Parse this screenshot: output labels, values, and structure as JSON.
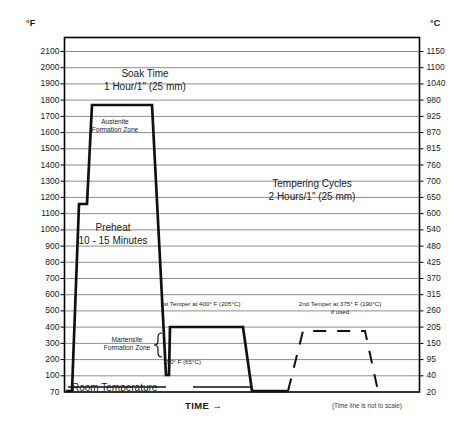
{
  "axes": {
    "fahrenheit_unit": "°F",
    "celsius_unit": "°C",
    "fahrenheit_ticks": [
      "2100",
      "2000",
      "1900",
      "1800",
      "1700",
      "1600",
      "1500",
      "1400",
      "1300",
      "1200",
      "1100",
      "1000",
      "900",
      "800",
      "700",
      "600",
      "500",
      "400",
      "300",
      "200",
      "100",
      "70"
    ],
    "celsius_ticks": [
      "1150",
      "1100",
      "1040",
      "980",
      "925",
      "870",
      "815",
      "760",
      "700",
      "650",
      "600",
      "540",
      "480",
      "425",
      "370",
      "315",
      "260",
      "205",
      "150",
      "95",
      "40",
      "20"
    ],
    "x_axis_label": "TIME  →",
    "scale_note": "(Time line is not to scale)"
  },
  "annotations": {
    "soak_line1": "Soak Time",
    "soak_line2": "1 Hour/1\" (25 mm)",
    "austenite_line1": "Austenite",
    "austenite_line2": "Formation Zone",
    "preheat_line1": "Preheat",
    "preheat_line2": "10 - 15 Minutes",
    "tempering_line1": "Tempering Cycles",
    "tempering_line2": "2 Hours/1\" (25 mm)",
    "temper1": "1st Temper at 400° F (205°C)",
    "temper2_line1": "2nd Temper at 375° F (190°C)",
    "temper2_line2": "if used",
    "martensite_line1": "Martensite",
    "martensite_line2": "Formation Zone",
    "quench_temp": "150° F (65°C)",
    "room_temperature": "Room Temperature"
  },
  "chart_data": {
    "type": "line",
    "xlabel": "TIME  →",
    "ylabel": "°F",
    "ylabel_secondary": "°C",
    "ylim": [
      70,
      2150
    ],
    "grid": true,
    "legend": "none",
    "yticks_f": [
      2100,
      2000,
      1900,
      1800,
      1700,
      1600,
      1500,
      1400,
      1300,
      1200,
      1100,
      1000,
      900,
      800,
      700,
      600,
      500,
      400,
      300,
      200,
      100,
      70
    ],
    "yticks_c": [
      1150,
      1100,
      1040,
      980,
      925,
      870,
      815,
      760,
      700,
      650,
      600,
      540,
      480,
      425,
      370,
      315,
      260,
      205,
      150,
      95,
      40,
      20
    ],
    "series": [
      {
        "name": "Primary heat treat cycle",
        "style": "solid",
        "points_f": [
          70,
          70,
          1200,
          1200,
          1750,
          1750,
          150,
          150,
          400,
          400,
          70,
          70
        ],
        "description": "Room temperature ramp to 1200F preheat, soak, ramp to 1750F austenitizing, soak, quench to 150F, first temper at 400F, cool to room temperature"
      },
      {
        "name": "2nd temper (optional)",
        "style": "dashed",
        "points_f": [
          70,
          375,
          375,
          70
        ],
        "description": "Optional second temper at 375F"
      }
    ],
    "key_values": {
      "preheat_f": 1200,
      "austenitize_f": 1750,
      "quench_f": 150,
      "quench_c": 65,
      "temper1_f": 400,
      "temper1_c": 205,
      "temper2_f": 375,
      "temper2_c": 190,
      "room_temp_f": 70,
      "soak_time": "1 Hour/1\" (25 mm)",
      "preheat_time": "10 - 15 Minutes",
      "temper_time": "2 Hours/1\" (25 mm)"
    }
  },
  "colors": {
    "curve": "#111111",
    "grid": "#808080",
    "frame": "#000000",
    "text": "#1a1a1a"
  }
}
